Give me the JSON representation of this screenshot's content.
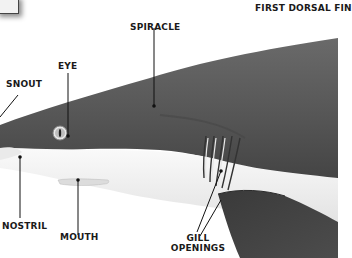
{
  "diagram": {
    "colors": {
      "body_dark": "#4a4a4a",
      "body_mid": "#5c5c5c",
      "belly": "#f4f4f4",
      "label": "#1a1a1a",
      "leader": "#111111"
    },
    "labels": {
      "first_dorsal_fin": "FIRST DORSAL FIN",
      "spiracle": "SPIRACLE",
      "eye": "EYE",
      "snout": "SNOUT",
      "nostril": "NOSTRIL",
      "mouth": "MOUTH",
      "gill_line1": "GILL",
      "gill_line2": "OPENINGS"
    }
  }
}
